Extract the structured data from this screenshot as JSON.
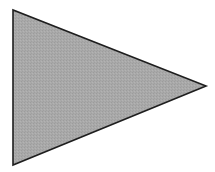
{
  "diagram": {
    "shape": "triangle",
    "orientation": "pointing-right",
    "vertices": [
      [
        13,
        10
      ],
      [
        13,
        165
      ],
      [
        206,
        86
      ]
    ],
    "fill_color": "#a9a9a9",
    "texture_color": "#9c9c9c",
    "stroke_color": "#1e1e1e",
    "stroke_width": 1.6,
    "background_color": "#ffffff"
  }
}
